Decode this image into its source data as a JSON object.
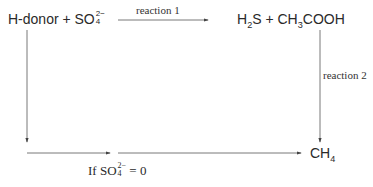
{
  "diagram": {
    "nodes": {
      "reactants": {
        "prefix": "H-donor + SO",
        "sub": "4",
        "sup": "2−"
      },
      "products": {
        "h2s": "H",
        "h2s_sub": "2",
        "h2s_tail": "S + CH",
        "ch3_sub": "3",
        "tail": "COOH"
      },
      "methane": {
        "base": "CH",
        "sub": "4"
      }
    },
    "labels": {
      "reaction1": "reaction 1",
      "reaction2": "reaction 2",
      "condition_prefix": "If SO",
      "condition_sub": "4",
      "condition_sup": "2−",
      "condition_suffix": " = 0"
    },
    "colors": {
      "line": "#555555",
      "text": "#2a2a2a"
    }
  }
}
